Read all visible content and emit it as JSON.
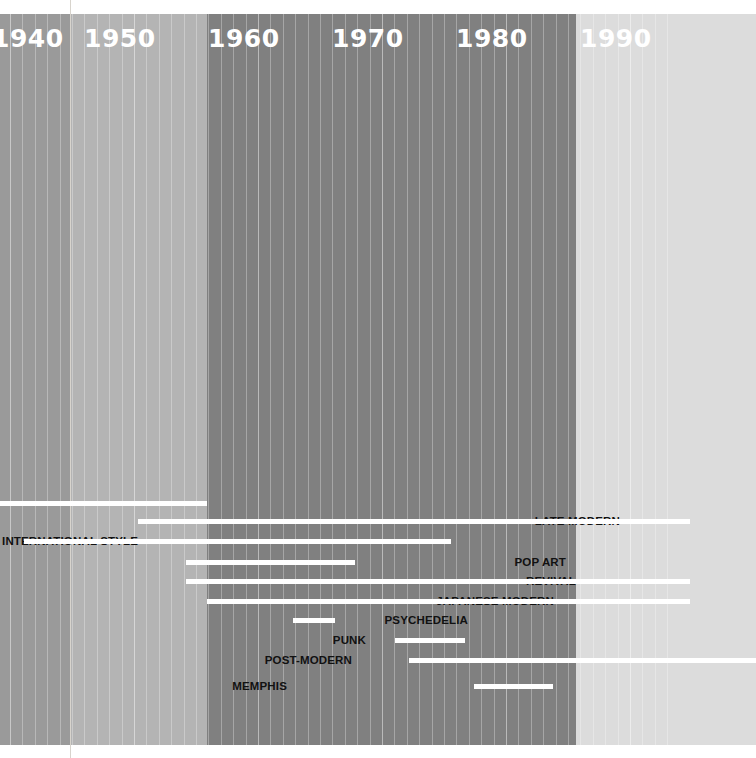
{
  "chart_data": {
    "type": "bar",
    "orientation": "horizontal-timeline",
    "xlabel": "",
    "ylabel": "",
    "xlim": [
      1936,
      1993
    ],
    "grid": true,
    "legend": "none",
    "axis_tick_labels": [
      "1940",
      "1950",
      "1960",
      "1970",
      "1980",
      "1990"
    ],
    "categories": [
      "",
      "LATE MODERN",
      "SWISS INTERNATIONAL STYLE",
      "POP ART",
      "REVIVAL",
      "JAPANESE MODERN",
      "PSYCHEDELIA",
      "PUNK",
      "POST-MODERN",
      "MEMPHIS"
    ],
    "spans": [
      {
        "label": "",
        "start": 1936,
        "end": 1952
      },
      {
        "label": "LATE MODERN",
        "start": 1945,
        "end": 1990
      },
      {
        "label": "SWISS INTERNATIONAL STYLE",
        "start": 1938,
        "end": 1993
      },
      {
        "label": "POP ART",
        "start": 1955,
        "end": 1964
      },
      {
        "label": "REVIVAL",
        "start": 1953,
        "end": 1990
      },
      {
        "label": "JAPANESE MODERN",
        "start": 1952,
        "end": 1990
      },
      {
        "label": "PSYCHEDELIA",
        "start": 1959,
        "end": 1963
      },
      {
        "label": "PUNK",
        "start": 1968,
        "end": 1974
      },
      {
        "label": "POST-MODERN",
        "start": 1969,
        "end": 1993
      },
      {
        "label": "MEMPHIS",
        "start": 1973,
        "end": 1980
      }
    ]
  },
  "axis": {
    "decades": [
      {
        "text": "1940",
        "x": -8
      },
      {
        "text": "1950",
        "x": 84
      },
      {
        "text": "1960",
        "x": 208
      },
      {
        "text": "1970",
        "x": 332
      },
      {
        "text": "1980",
        "x": 456
      },
      {
        "text": "1990",
        "x": 580
      }
    ],
    "tick_color": "#ffffff"
  },
  "bands": [
    {
      "name": "band-1940s-early",
      "x": 0,
      "width": 70,
      "color": "#9a9a9a"
    },
    {
      "name": "band-1950s",
      "x": 70,
      "width": 137,
      "color": "#b4b4b4"
    },
    {
      "name": "band-1960s-1980s",
      "x": 207,
      "width": 369,
      "color": "#808080"
    },
    {
      "name": "band-1990s",
      "x": 576,
      "width": 180,
      "color": "#dcdcdc"
    }
  ],
  "rows": [
    {
      "label": "",
      "label_right": 0,
      "bar_x": 0,
      "bar_w": 207,
      "y": 493
    },
    {
      "label": "LATE MODERN",
      "label_right": 620,
      "bar_x": 138,
      "bar_w": 552,
      "y": 511
    },
    {
      "label": "SWISS INTERNATIONAL STYLE",
      "label_right": 138,
      "bar_x": 24,
      "bar_w": 427,
      "y": 531
    },
    {
      "label": "POP ART",
      "label_right": 566,
      "bar_x": 186,
      "bar_w": 169,
      "y": 552
    },
    {
      "label": "REVIVAL",
      "label_right": 576,
      "bar_x": 186,
      "bar_w": 504,
      "y": 571
    },
    {
      "label": "JAPANESE MODERN",
      "label_right": 554,
      "bar_x": 207,
      "bar_w": 483,
      "y": 591
    },
    {
      "label": "PSYCHEDELIA",
      "label_right": 468,
      "bar_x": 293,
      "bar_w": 42,
      "y": 610
    },
    {
      "label": "PUNK",
      "label_right": 366,
      "bar_x": 395,
      "bar_w": 70,
      "y": 630
    },
    {
      "label": "POST-MODERN",
      "label_right": 352,
      "bar_x": 409,
      "bar_w": 347,
      "y": 650
    },
    {
      "label": "MEMPHIS",
      "label_right": 287,
      "bar_x": 474,
      "bar_w": 79,
      "y": 676
    }
  ],
  "colors": {
    "bar": "#ffffff",
    "label_text": "#111111",
    "decade_text": "#ffffff",
    "page_background": "#ffffff",
    "guide_line": "#d8d4cd"
  },
  "layout": {
    "top_margin": 14,
    "band_bottom": 745,
    "px_per_decade": 124,
    "year_origin_x": -8,
    "year_origin_value": 1940
  }
}
